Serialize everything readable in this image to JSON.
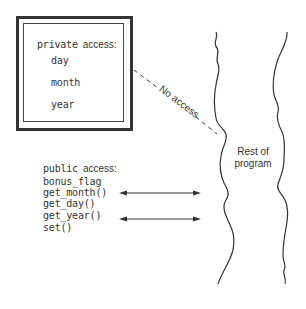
{
  "private_box": {
    "title_mono": "private",
    "title_sans": "access:",
    "members": [
      "day",
      "month",
      "year"
    ]
  },
  "no_access_label": "No access",
  "public_section": {
    "title_mono": "public",
    "title_sans": "access:",
    "members": [
      "bonus_flag",
      "get_month()",
      "get_day()",
      "get_year()",
      "set()"
    ]
  },
  "rest_of_program": {
    "line1": "Rest of",
    "line2": "program"
  },
  "arrows": [
    {
      "from": "get_month()",
      "to": "Rest of program",
      "type": "bidirectional"
    },
    {
      "from": "get_year()",
      "to": "Rest of program",
      "type": "bidirectional"
    }
  ],
  "colors": {
    "stroke": "#333333",
    "background": "#ffffff"
  }
}
